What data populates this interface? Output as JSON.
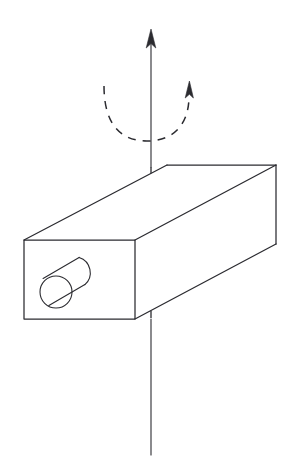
{
  "figure": {
    "background_color": "#ffffff",
    "ink_color": "#2b2b30",
    "width": 297,
    "height": 466,
    "caption": ""
  },
  "axis": {
    "name": "vertical-rotation-axis",
    "label": "",
    "style": "solid line with upward arrowhead, dashed where hidden behind block",
    "top_x": 151,
    "top_y": 30,
    "bottom_x": 151,
    "bottom_y": 455,
    "arrowhead_direction": "up",
    "hidden_segment_top_y": 167,
    "hidden_segment_bottom_y": 317
  },
  "rotation_arrow": {
    "name": "rotation-direction-arc",
    "label": "",
    "style": "dashed arc with arrowhead at right end",
    "direction": "counterclockwise-from-left-to-right",
    "left_x": 104,
    "left_y": 86,
    "right_x": 189,
    "right_y": 92,
    "bottom_y": 140
  },
  "block": {
    "name": "rectangular-block",
    "label": "",
    "shape": "rectangular cuboid shown in oblique projection",
    "front_face": {
      "label": "",
      "left": 24,
      "right": 135,
      "top": 240,
      "bottom": 319
    },
    "far_top_right_x": 276,
    "far_top_right_y": 165,
    "far_bottom_right_y": 244,
    "back_top_left_x": 167,
    "back_top_left_y": 165
  },
  "cylinder": {
    "name": "cylindrical-hole-boss",
    "label": "",
    "shape": "cylinder protruding from the block front face",
    "near_center_x": 56,
    "near_center_y": 292,
    "near_radius": 16,
    "far_center_x": 92,
    "far_center_y": 271,
    "far_radius": 16
  },
  "legend": {
    "items": []
  }
}
